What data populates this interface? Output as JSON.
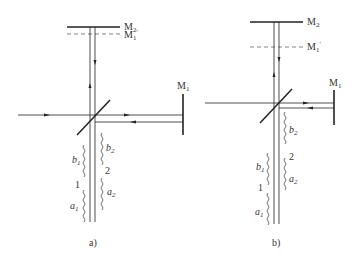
{
  "figure": {
    "colors": {
      "line": "#222222",
      "label": "#333333",
      "dashed": "#666666",
      "background": "#ffffff"
    },
    "panels": [
      {
        "id": "a",
        "caption": "a)",
        "mirror_fixed": {
          "label": "M",
          "sub": "2"
        },
        "mirror_virtual": {
          "label": "M",
          "sub": "1",
          "prime": "'"
        },
        "mirror_movable": {
          "label": "M",
          "sub": "1"
        },
        "wave_labels": {
          "b1": {
            "label": "b",
            "sub": "1"
          },
          "b2": {
            "label": "b",
            "sub": "2"
          },
          "a1": {
            "label": "a",
            "sub": "1"
          },
          "a2": {
            "label": "a",
            "sub": "2"
          },
          "train1": "1",
          "train2": "2"
        }
      },
      {
        "id": "b",
        "caption": "b)",
        "mirror_fixed": {
          "label": "M",
          "sub": "2"
        },
        "mirror_virtual": {
          "label": "M",
          "sub": "1",
          "prime": "'"
        },
        "mirror_movable": {
          "label": "M",
          "sub": "1"
        },
        "wave_labels": {
          "b1": {
            "label": "b",
            "sub": "1"
          },
          "b2": {
            "label": "b",
            "sub": "2"
          },
          "a1": {
            "label": "a",
            "sub": "1"
          },
          "a2": {
            "label": "a",
            "sub": "2"
          },
          "train1": "1",
          "train2": "2"
        }
      }
    ]
  }
}
